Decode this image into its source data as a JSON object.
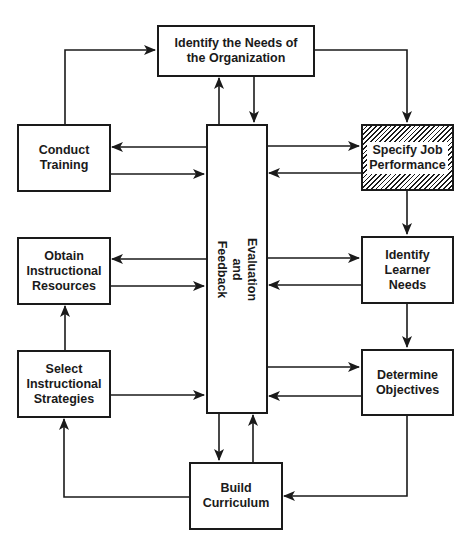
{
  "diagram": {
    "nodes": {
      "needs_org": "Identify the Needs of\nthe Organization",
      "conduct_training": "Conduct\nTraining",
      "specify_job": "Specify Job\nPerformance",
      "evaluation": "Evaluation\nand\nFeedback",
      "obtain_resources": "Obtain\nInstructional\nResources",
      "identify_learner": "Identify\nLearner\nNeeds",
      "select_strategies": "Select\nInstructional\nStrategies",
      "determine_objectives": "Determine\nObjectives",
      "build_curriculum": "Build\nCurriculum"
    },
    "edges": [
      {
        "from": "Identify the Needs of the Organization",
        "to": "Specify Job Performance"
      },
      {
        "from": "Specify Job Performance",
        "to": "Identify Learner Needs"
      },
      {
        "from": "Identify Learner Needs",
        "to": "Determine Objectives"
      },
      {
        "from": "Determine Objectives",
        "to": "Build Curriculum"
      },
      {
        "from": "Build Curriculum",
        "to": "Select Instructional Strategies"
      },
      {
        "from": "Select Instructional Strategies",
        "to": "Obtain Instructional Resources"
      },
      {
        "from": "Obtain Instructional Resources",
        "to": "Conduct Training"
      },
      {
        "from": "Conduct Training",
        "to": "Identify the Needs of the Organization"
      },
      {
        "from": "Evaluation and Feedback",
        "to": "all stages",
        "bidirectional": true
      }
    ],
    "highlight_node": "Specify Job Performance",
    "colors": {
      "line": "#1a1a1a",
      "background": "#ffffff"
    }
  }
}
